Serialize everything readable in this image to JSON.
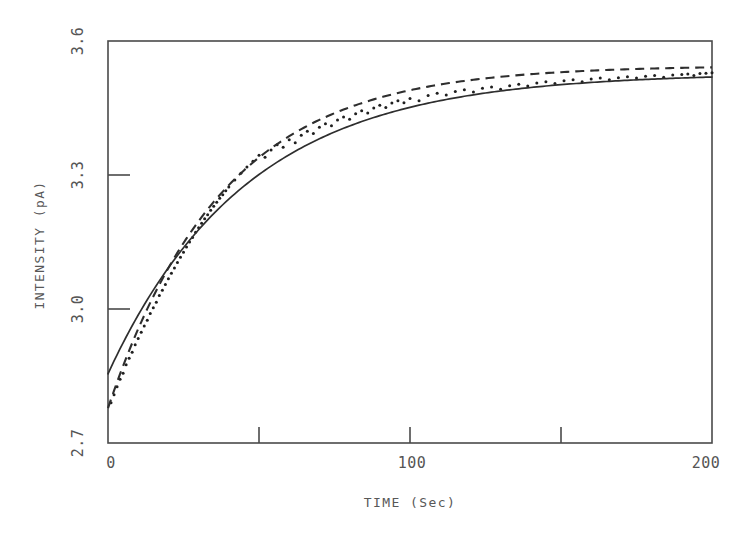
{
  "figure": {
    "background_color": "#ffffff",
    "ink_color": "#3a3a3a"
  },
  "chart_data": {
    "type": "scatter",
    "title": "",
    "subtitle": "",
    "xlabel": "TIME (Sec)",
    "ylabel": "INTENSITY (pA)",
    "xlim": [
      0,
      200
    ],
    "ylim": [
      2.7,
      3.6
    ],
    "grid": false,
    "legend_position": "none",
    "x_ticks": [
      0,
      50,
      100,
      150,
      200
    ],
    "x_tick_labels": [
      "0",
      "",
      "100",
      "",
      "200"
    ],
    "x_tick_labels_shown": [
      "0",
      "100",
      "200"
    ],
    "y_ticks": [
      2.7,
      3.0,
      3.3,
      3.6
    ],
    "y_tick_labels": [
      "2.7",
      "3.0",
      "3.3",
      "3.6"
    ],
    "annotations": [],
    "series": [
      {
        "name": "measured data",
        "type": "scatter",
        "marker": "dot",
        "color": "#1f1f1f",
        "x": [
          1,
          2,
          3,
          4,
          5,
          6,
          7,
          8,
          9,
          10,
          11,
          12,
          13,
          14,
          15,
          16,
          17,
          18,
          19,
          20,
          21,
          22,
          23,
          24,
          25,
          26,
          27,
          28,
          29,
          30,
          31,
          32,
          33,
          34,
          35,
          36,
          37,
          38,
          39,
          40,
          42,
          44,
          46,
          48,
          50,
          52,
          54,
          56,
          58,
          60,
          62,
          64,
          66,
          68,
          70,
          72,
          74,
          76,
          78,
          80,
          82,
          84,
          86,
          88,
          90,
          92,
          94,
          96,
          98,
          100,
          103,
          106,
          109,
          112,
          115,
          118,
          121,
          124,
          127,
          130,
          133,
          136,
          139,
          142,
          145,
          148,
          151,
          154,
          157,
          160,
          163,
          166,
          169,
          172,
          175,
          178,
          181,
          184,
          187,
          190,
          192,
          194,
          196,
          198,
          200
        ],
        "y": [
          2.79,
          2.808,
          2.826,
          2.843,
          2.856,
          2.875,
          2.89,
          2.903,
          2.92,
          2.934,
          2.948,
          2.962,
          2.975,
          2.99,
          3.003,
          3.015,
          3.03,
          3.042,
          3.055,
          3.068,
          3.08,
          3.092,
          3.104,
          3.116,
          3.127,
          3.139,
          3.15,
          3.16,
          3.172,
          3.182,
          3.192,
          3.202,
          3.211,
          3.221,
          3.23,
          3.239,
          3.248,
          3.256,
          3.265,
          3.273,
          3.289,
          3.304,
          3.318,
          3.331,
          3.344,
          3.34,
          3.356,
          3.368,
          3.362,
          3.379,
          3.372,
          3.389,
          3.398,
          3.393,
          3.407,
          3.415,
          3.41,
          3.423,
          3.43,
          3.425,
          3.437,
          3.444,
          3.439,
          3.45,
          3.456,
          3.451,
          3.461,
          3.466,
          3.462,
          3.471,
          3.466,
          3.478,
          3.483,
          3.479,
          3.487,
          3.491,
          3.486,
          3.494,
          3.497,
          3.492,
          3.5,
          3.503,
          3.499,
          3.506,
          3.509,
          3.505,
          3.511,
          3.513,
          3.509,
          3.515,
          3.517,
          3.513,
          3.518,
          3.52,
          3.517,
          3.521,
          3.523,
          3.519,
          3.524,
          3.525,
          3.526,
          3.523,
          3.527,
          3.528,
          3.529
        ]
      },
      {
        "name": "fit curve solid",
        "type": "line",
        "linestyle": "solid",
        "color": "#2e2e2e",
        "model": "exponential saturation",
        "y0": 2.855,
        "yinf": 3.528,
        "tau": 46,
        "x": [
          0,
          5,
          10,
          15,
          20,
          25,
          30,
          35,
          40,
          45,
          50,
          60,
          70,
          80,
          90,
          100,
          110,
          120,
          130,
          140,
          150,
          160,
          170,
          180,
          190,
          200
        ],
        "y": [
          2.855,
          2.924,
          2.986,
          3.042,
          3.092,
          3.137,
          3.177,
          3.213,
          3.246,
          3.275,
          3.301,
          3.345,
          3.38,
          3.408,
          3.43,
          3.448,
          3.462,
          3.473,
          3.482,
          3.49,
          3.496,
          3.5,
          3.504,
          3.507,
          3.51,
          3.512
        ]
      },
      {
        "name": "fit curve dashed",
        "type": "line",
        "linestyle": "dashed",
        "color": "#2e2e2e",
        "model": "exponential saturation",
        "y0": 2.778,
        "yinf": 3.545,
        "tau": 38,
        "x": [
          0,
          5,
          10,
          15,
          20,
          25,
          30,
          35,
          40,
          45,
          50,
          60,
          70,
          80,
          90,
          100,
          110,
          120,
          130,
          140,
          150,
          160,
          170,
          180,
          190,
          200
        ],
        "y": [
          2.778,
          2.873,
          2.956,
          3.029,
          3.093,
          3.149,
          3.198,
          3.241,
          3.279,
          3.312,
          3.341,
          3.388,
          3.424,
          3.451,
          3.471,
          3.487,
          3.499,
          3.508,
          3.515,
          3.52,
          3.524,
          3.527,
          3.53,
          3.532,
          3.533,
          3.534
        ]
      }
    ]
  },
  "axes": {
    "plot_area": {
      "left": 108,
      "top": 41,
      "right": 712,
      "bottom": 443
    },
    "x_axis_title": "TIME (Sec)",
    "y_axis_title": "INTENSITY (pA)"
  }
}
